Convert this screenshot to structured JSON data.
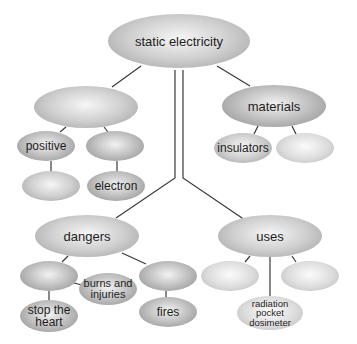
{
  "diagram": {
    "type": "concept-map",
    "root": {
      "id": "static",
      "label": "static electricity"
    },
    "nodes": [
      {
        "id": "static",
        "label": "static electricity",
        "cx": 179,
        "cy": 41,
        "w": 142,
        "h": 54,
        "shade": "mid",
        "size": "lg"
      },
      {
        "id": "branchA",
        "label": "",
        "cx": 86,
        "cy": 107,
        "w": 104,
        "h": 42,
        "shade": "mid",
        "size": "lg"
      },
      {
        "id": "materials",
        "label": "materials",
        "cx": 274,
        "cy": 106,
        "w": 104,
        "h": 42,
        "shade": "dark",
        "size": "lg"
      },
      {
        "id": "positive",
        "label": "positive",
        "cx": 46,
        "cy": 146,
        "w": 58,
        "h": 30,
        "shade": "dark",
        "size": "md"
      },
      {
        "id": "branchA2",
        "label": "",
        "cx": 115,
        "cy": 146,
        "w": 58,
        "h": 30,
        "shade": "dark",
        "size": "md"
      },
      {
        "id": "insulators",
        "label": "insulators",
        "cx": 243,
        "cy": 148,
        "w": 58,
        "h": 30,
        "shade": "mid",
        "size": "md"
      },
      {
        "id": "matB",
        "label": "",
        "cx": 305,
        "cy": 148,
        "w": 58,
        "h": 30,
        "shade": "light",
        "size": "md"
      },
      {
        "id": "posChild",
        "label": "",
        "cx": 51,
        "cy": 186,
        "w": 58,
        "h": 30,
        "shade": "mid",
        "size": "md"
      },
      {
        "id": "electron",
        "label": "electron",
        "cx": 116,
        "cy": 186,
        "w": 58,
        "h": 30,
        "shade": "dark",
        "size": "md"
      },
      {
        "id": "dangers",
        "label": "dangers",
        "cx": 87,
        "cy": 236,
        "w": 104,
        "h": 42,
        "shade": "mid",
        "size": "lg"
      },
      {
        "id": "uses",
        "label": "uses",
        "cx": 270,
        "cy": 236,
        "w": 104,
        "h": 42,
        "shade": "mid",
        "size": "lg"
      },
      {
        "id": "danger1",
        "label": "",
        "cx": 49,
        "cy": 276,
        "w": 58,
        "h": 30,
        "shade": "dark",
        "size": "md"
      },
      {
        "id": "burns",
        "label": "burns and injuries",
        "cx": 108,
        "cy": 289,
        "w": 58,
        "h": 32,
        "shade": "dark",
        "size": "sm"
      },
      {
        "id": "danger3",
        "label": "",
        "cx": 168,
        "cy": 276,
        "w": 58,
        "h": 30,
        "shade": "dark",
        "size": "md"
      },
      {
        "id": "stopheart",
        "label": "stop the heart",
        "cx": 49,
        "cy": 316,
        "w": 58,
        "h": 32,
        "shade": "dark",
        "size": "md"
      },
      {
        "id": "fires",
        "label": "fires",
        "cx": 168,
        "cy": 312,
        "w": 58,
        "h": 30,
        "shade": "dark",
        "size": "md"
      },
      {
        "id": "use1",
        "label": "",
        "cx": 230,
        "cy": 276,
        "w": 58,
        "h": 30,
        "shade": "light",
        "size": "md"
      },
      {
        "id": "use3",
        "label": "",
        "cx": 310,
        "cy": 276,
        "w": 58,
        "h": 30,
        "shade": "light",
        "size": "md"
      },
      {
        "id": "dosimeter",
        "label": "radiation pocket dosimeter",
        "cx": 270,
        "cy": 313,
        "w": 66,
        "h": 34,
        "shade": "light",
        "size": "xs"
      }
    ],
    "edges": [
      {
        "from": "static",
        "to": "branchA",
        "points": [
          [
            141,
            66
          ],
          [
            112,
            87
          ]
        ]
      },
      {
        "from": "static",
        "to": "materials",
        "points": [
          [
            217,
            66
          ],
          [
            250,
            86
          ]
        ]
      },
      {
        "from": "static",
        "to": "dangers",
        "points": [
          [
            175,
            70
          ],
          [
            175,
            178
          ],
          [
            116,
            218
          ]
        ]
      },
      {
        "from": "static",
        "to": "uses",
        "points": [
          [
            183,
            70
          ],
          [
            183,
            178
          ],
          [
            245,
            220
          ]
        ]
      },
      {
        "from": "branchA",
        "to": "positive",
        "points": [
          [
            66,
            127
          ],
          [
            60,
            132
          ]
        ]
      },
      {
        "from": "branchA",
        "to": "branchA2",
        "points": [
          [
            104,
            127
          ],
          [
            108,
            132
          ]
        ]
      },
      {
        "from": "materials",
        "to": "insulators",
        "points": [
          [
            258,
            126
          ],
          [
            254,
            134
          ]
        ]
      },
      {
        "from": "materials",
        "to": "matB",
        "points": [
          [
            292,
            126
          ],
          [
            296,
            134
          ]
        ]
      },
      {
        "from": "positive",
        "to": "posChild",
        "points": [
          [
            51,
            161
          ],
          [
            51,
            171
          ]
        ]
      },
      {
        "from": "branchA2",
        "to": "electron",
        "points": [
          [
            117,
            161
          ],
          [
            117,
            171
          ]
        ]
      },
      {
        "from": "dangers",
        "to": "danger1",
        "points": [
          [
            68,
            256
          ],
          [
            62,
            262
          ]
        ]
      },
      {
        "from": "dangers",
        "to": "danger3",
        "points": [
          [
            122,
            253
          ],
          [
            146,
            264
          ]
        ]
      },
      {
        "from": "danger1",
        "to": "burns",
        "points": [
          [
            74,
            283
          ],
          [
            82,
            285
          ]
        ]
      },
      {
        "from": "danger1",
        "to": "stopheart",
        "points": [
          [
            49,
            291
          ],
          [
            49,
            300
          ]
        ]
      },
      {
        "from": "danger3",
        "to": "fires",
        "points": [
          [
            166,
            291
          ],
          [
            166,
            297
          ]
        ]
      },
      {
        "from": "uses",
        "to": "use1",
        "points": [
          [
            250,
            256
          ],
          [
            245,
            262
          ]
        ]
      },
      {
        "from": "uses",
        "to": "dosimeter",
        "points": [
          [
            270,
            257
          ],
          [
            270,
            296
          ]
        ]
      },
      {
        "from": "uses",
        "to": "use3",
        "points": [
          [
            292,
            256
          ],
          [
            296,
            262
          ]
        ]
      }
    ],
    "colors": {
      "line": "#3a3a3a",
      "text": "#1e1e1e",
      "background": "#ffffff"
    }
  }
}
